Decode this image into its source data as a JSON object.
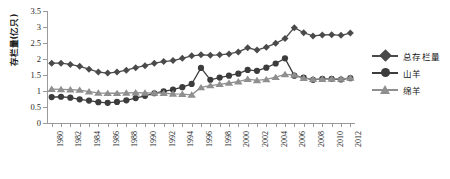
{
  "chart_data": {
    "type": "line",
    "title": "",
    "xlabel": "",
    "ylabel": "存栏量(亿只)",
    "ylim": [
      0,
      3.5
    ],
    "yticks": [
      0,
      0.5,
      1,
      1.5,
      2,
      2.5,
      3,
      3.5
    ],
    "ytick_labels": [
      "0",
      "0.5",
      "1",
      "1.5",
      "2",
      "2.5",
      "3",
      "3.5"
    ],
    "grid": false,
    "legend_position": "right",
    "x": [
      1980,
      1981,
      1982,
      1983,
      1984,
      1985,
      1986,
      1987,
      1988,
      1989,
      1990,
      1991,
      1992,
      1993,
      1994,
      1995,
      1996,
      1997,
      1998,
      1999,
      2000,
      2001,
      2002,
      2003,
      2004,
      2005,
      2006,
      2007,
      2008,
      2009,
      2010,
      2011,
      2012
    ],
    "xtick_labels": [
      "1980",
      "1982",
      "1984",
      "1986",
      "1988",
      "1990",
      "1992",
      "1994",
      "1996",
      "1998",
      "2000",
      "2002",
      "2004",
      "2006",
      "2008",
      "2010",
      "2012"
    ],
    "series": [
      {
        "name": "总存栏量",
        "marker": "diamond",
        "color": "#4a4a4a",
        "values": [
          1.87,
          1.87,
          1.83,
          1.77,
          1.68,
          1.59,
          1.56,
          1.59,
          1.65,
          1.73,
          1.79,
          1.87,
          1.92,
          1.95,
          2.02,
          2.1,
          2.13,
          2.12,
          2.13,
          2.16,
          2.22,
          2.35,
          2.28,
          2.37,
          2.49,
          2.64,
          2.98,
          2.82,
          2.72,
          2.75,
          2.76,
          2.74,
          2.81
        ]
      },
      {
        "name": "山羊",
        "marker": "circle",
        "color": "#3c3c3c",
        "values": [
          0.81,
          0.82,
          0.79,
          0.74,
          0.7,
          0.65,
          0.63,
          0.66,
          0.71,
          0.78,
          0.85,
          0.93,
          0.99,
          1.04,
          1.12,
          1.22,
          1.72,
          1.35,
          1.42,
          1.48,
          1.54,
          1.66,
          1.63,
          1.73,
          1.86,
          2.02,
          1.48,
          1.42,
          1.35,
          1.38,
          1.38,
          1.36,
          1.4
        ]
      },
      {
        "name": "绵羊",
        "marker": "triangle",
        "color": "#8f8f8f",
        "values": [
          1.06,
          1.05,
          1.04,
          1.03,
          0.98,
          0.94,
          0.93,
          0.93,
          0.94,
          0.95,
          0.94,
          0.94,
          0.93,
          0.91,
          0.9,
          0.88,
          1.11,
          1.17,
          1.21,
          1.25,
          1.29,
          1.37,
          1.33,
          1.36,
          1.43,
          1.52,
          1.5,
          1.4,
          1.37,
          1.37,
          1.38,
          1.38,
          1.41
        ]
      }
    ]
  },
  "legend": {
    "items": [
      {
        "label": "总存栏量"
      },
      {
        "label": "山羊"
      },
      {
        "label": "绵羊"
      }
    ]
  }
}
